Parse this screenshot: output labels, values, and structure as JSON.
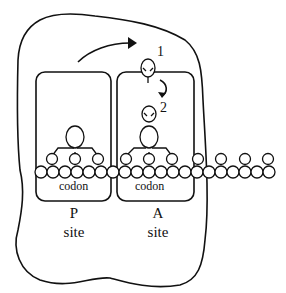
{
  "diagram": {
    "colors": {
      "stroke": "#111111",
      "background": "#ffffff"
    },
    "sites": [
      {
        "id": "P",
        "letter": "P",
        "word": "site",
        "codon_label": "codon"
      },
      {
        "id": "A",
        "letter": "A",
        "word": "site",
        "codon_label": "codon"
      }
    ],
    "trna_labels": {
      "first": "1",
      "second": "2"
    },
    "icons": {
      "movement_arrow": "curved-arrow-right",
      "descent_arrow": "curved-arrow-down"
    }
  }
}
